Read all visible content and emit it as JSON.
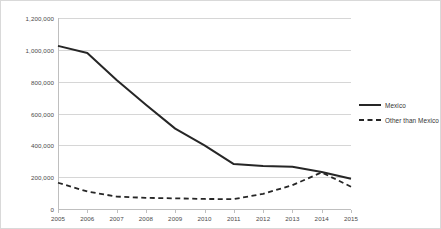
{
  "chart_data": {
    "type": "line",
    "title": "",
    "subtitle": "",
    "xlabel": "",
    "ylabel": "",
    "x": [
      2005,
      2006,
      2007,
      2008,
      2009,
      2010,
      2011,
      2012,
      2013,
      2014,
      2015
    ],
    "categories": [
      "2005",
      "2006",
      "2007",
      "2008",
      "2009",
      "2010",
      "2011",
      "2012",
      "2013",
      "2014",
      "2015"
    ],
    "series": [
      {
        "name": "Mexico",
        "style": "solid",
        "color": "#262626",
        "values": [
          1025000,
          980000,
          810000,
          655000,
          505000,
          400000,
          282000,
          270000,
          265000,
          232000,
          190000
        ]
      },
      {
        "name": "Other than Mexico",
        "style": "dashed",
        "color": "#262626",
        "values": [
          165000,
          110000,
          78000,
          70000,
          67000,
          63000,
          62000,
          95000,
          150000,
          230000,
          140000
        ]
      }
    ],
    "ylim": [
      0,
      1200000
    ],
    "xlim": [
      2005,
      2015
    ],
    "yticks": [
      0,
      200000,
      400000,
      600000,
      800000,
      1000000,
      1200000
    ],
    "ytick_labels": [
      "0",
      "200,000",
      "400,000",
      "600,000",
      "800,000",
      "1,000,000",
      "1,200,000"
    ],
    "xtick_labels": [
      "2005",
      "2006",
      "2007",
      "2008",
      "2009",
      "2010",
      "2011",
      "2012",
      "2013",
      "2014",
      "2015"
    ],
    "grid": "horizontal",
    "grid_color": "#d6d6d6",
    "legend_position": "right",
    "legend_entries": [
      "Mexico",
      "Other than Mexico"
    ],
    "frame_border_color": "#d9d9d9",
    "axis_color": "#bfbfbf",
    "background": "#ffffff"
  }
}
